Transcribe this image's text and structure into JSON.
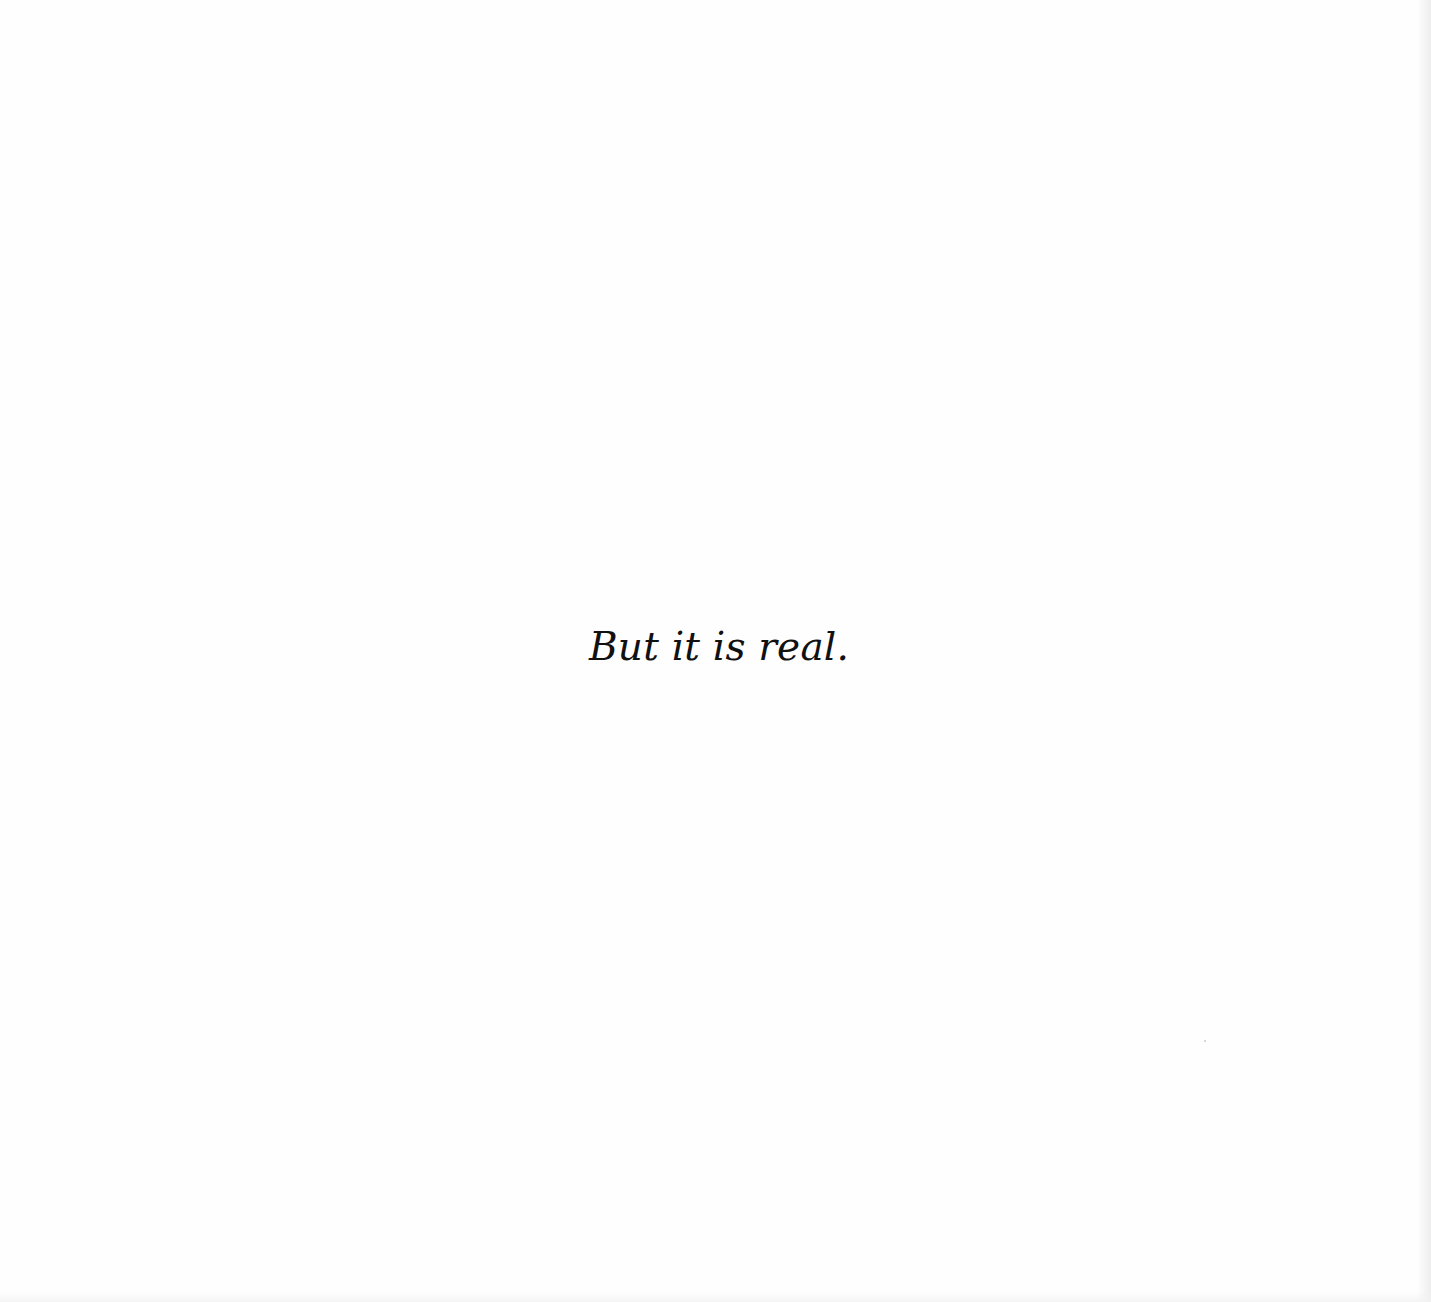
{
  "page": {
    "text": "But it is real.",
    "background_color": "#fefefe",
    "text_color": "#111111"
  }
}
